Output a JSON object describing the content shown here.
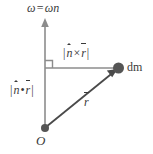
{
  "figure": {
    "type": "physics-vector-diagram",
    "background_color": "#ffffff",
    "line_color": "#8c8c8c",
    "vector_color": "#4a4a4a",
    "text_color": "#3a3a3a",
    "point_color": "#555555"
  },
  "labels": {
    "axis": {
      "omega_vec": "ω",
      "equals": "=",
      "omega_scalar": "ω",
      "n_hat": "n",
      "full_text": "ω̄ = ωn̂"
    },
    "cross": {
      "open_bar": "|",
      "n_hat": "n",
      "operator": "×",
      "r_vec": "r",
      "close_bar": "|",
      "full_text": "|n̂ × r̄|"
    },
    "dot": {
      "open_bar": "|",
      "n_hat": "n",
      "operator": "•",
      "r_vec": "r",
      "close_bar": "|",
      "full_text": "|n̂ • r̄|"
    },
    "mass_element": "dm",
    "position_vector": "r",
    "origin": "O"
  },
  "geometry": {
    "origin_point": [
      45,
      128
    ],
    "corner_point": [
      45,
      68
    ],
    "dm_point": [
      118,
      68
    ],
    "axis_arrow_tip": [
      45,
      19
    ],
    "right_angle_marker": true
  }
}
